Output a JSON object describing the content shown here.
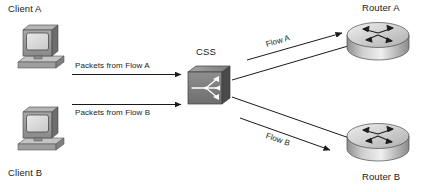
{
  "diagram": {
    "background": "#ffffff",
    "line_color": "#1a1a1a",
    "text_color": "#1a1a1a"
  },
  "nodes": {
    "client_a": {
      "label": "Client A",
      "icon": "desktop-computer-icon",
      "label_x": 8,
      "label_y": 4
    },
    "client_b": {
      "label": "Client B",
      "icon": "desktop-computer-icon",
      "label_x": 8,
      "label_y": 168
    },
    "css": {
      "label": "CSS",
      "icon": "content-switch-icon",
      "label_x": 196,
      "label_y": 47
    },
    "router_a": {
      "label": "Router A",
      "icon": "router-icon",
      "label_x": 362,
      "label_y": 3
    },
    "router_b": {
      "label": "Router B",
      "icon": "router-icon",
      "label_x": 362,
      "label_y": 172
    }
  },
  "connections": {
    "packets_flow_a": {
      "label": "Packets from Flow A",
      "label_x": 75,
      "label_y": 62,
      "direction": "client-a-to-css"
    },
    "packets_flow_b": {
      "label": "Packets from Flow B",
      "label_x": 75,
      "label_y": 112,
      "direction": "client-b-to-css"
    },
    "flow_a": {
      "label": "Flow A",
      "label_x": 266,
      "label_y": 40,
      "direction": "css-to-router-a"
    },
    "flow_b": {
      "label": "Flow B",
      "label_x": 268,
      "label_y": 135,
      "direction": "css-to-router-b"
    }
  }
}
